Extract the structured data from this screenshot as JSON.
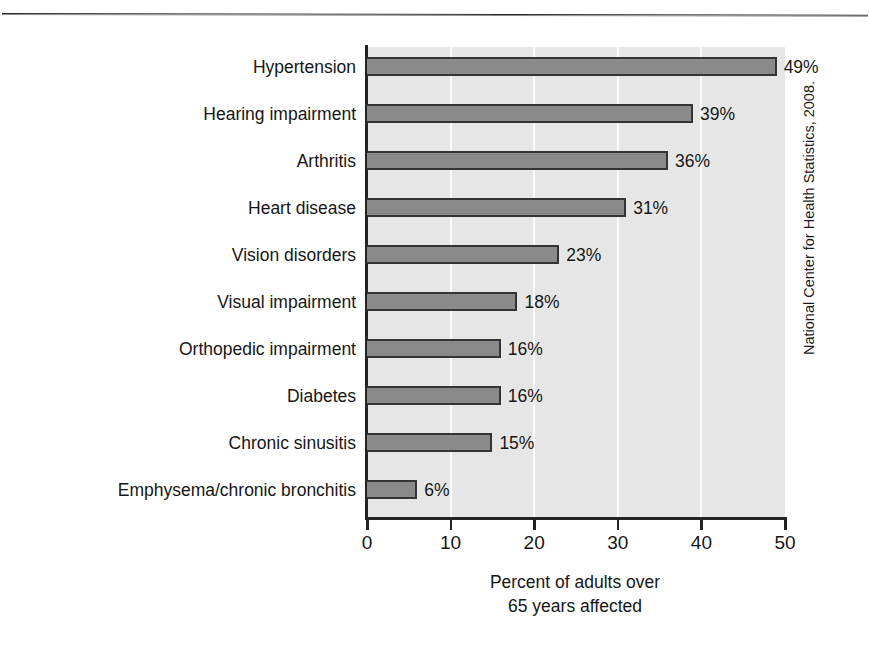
{
  "chart_data": {
    "type": "bar",
    "orientation": "horizontal",
    "title": "",
    "xlabel_line1": "Percent of adults over",
    "xlabel_line2": "65 years affected",
    "ylabel": "",
    "xlim": [
      0,
      50
    ],
    "grid": true,
    "legend": null,
    "source": "National Center for Health Statistics, 2008.",
    "xticks": [
      "0",
      "10",
      "20",
      "30",
      "40",
      "50"
    ],
    "xtick_values": [
      0,
      10,
      20,
      30,
      40,
      50
    ],
    "categories": [
      "Hypertension",
      "Hearing impairment",
      "Arthritis",
      "Heart disease",
      "Vision disorders",
      "Visual impairment",
      "Orthopedic impairment",
      "Diabetes",
      "Chronic sinusitis",
      "Emphysema/chronic bronchitis"
    ],
    "values": [
      49,
      39,
      36,
      31,
      23,
      18,
      16,
      16,
      15,
      6
    ],
    "value_labels": [
      "49%",
      "39%",
      "36%",
      "31%",
      "23%",
      "18%",
      "16%",
      "16%",
      "15%",
      "6%"
    ],
    "colors": {
      "bar_fill": "#8a8a8a",
      "bar_border": "#343434",
      "plot_background": "#e6e6e6",
      "gridline": "#fafafa",
      "axis": "#242424",
      "text": "#161616"
    }
  }
}
